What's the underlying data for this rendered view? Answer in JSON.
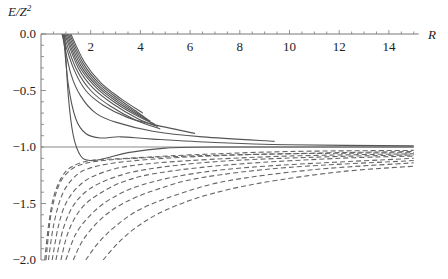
{
  "chart_data": {
    "type": "line",
    "title": "",
    "xlabel": "R",
    "ylabel": "E/Z²",
    "xlim": [
      0,
      15
    ],
    "ylim": [
      -2.0,
      0.0
    ],
    "grid": false,
    "legend": null,
    "x_ticks": [
      "2",
      "4",
      "6",
      "8",
      "10",
      "12",
      "14"
    ],
    "y_ticks": [
      "0.0",
      "-0.5",
      "-1.0",
      "-1.5",
      "-2.0"
    ],
    "reference_line": {
      "y": -1.0,
      "style": "solid",
      "x_range": [
        0,
        15
      ]
    },
    "series": [
      {
        "name": "solid-1",
        "style": "solid",
        "kind": "bound-min",
        "points": [
          [
            0.95,
            0.0
          ],
          [
            1.1,
            -0.55
          ],
          [
            1.3,
            -0.9
          ],
          [
            1.6,
            -1.08
          ],
          [
            2.0,
            -1.12
          ],
          [
            2.6,
            -1.1
          ],
          [
            3.5,
            -1.05
          ],
          [
            5,
            -1.01
          ],
          [
            7,
            -1.0
          ],
          [
            15,
            -1.0
          ]
        ]
      },
      {
        "name": "solid-2",
        "style": "solid",
        "kind": "shoulder",
        "points": [
          [
            0.9,
            0.0
          ],
          [
            1.1,
            -0.45
          ],
          [
            1.4,
            -0.75
          ],
          [
            1.8,
            -0.88
          ],
          [
            2.4,
            -0.92
          ],
          [
            3.2,
            -0.91
          ],
          [
            4.5,
            -0.93
          ],
          [
            7,
            -0.96
          ],
          [
            10,
            -0.98
          ],
          [
            15,
            -0.99
          ]
        ]
      },
      {
        "name": "solid-3",
        "style": "solid",
        "points": [
          [
            0.85,
            0.0
          ],
          [
            1.2,
            -0.35
          ],
          [
            1.6,
            -0.55
          ],
          [
            2.2,
            -0.7
          ],
          [
            3,
            -0.78
          ],
          [
            4.5,
            -0.86
          ],
          [
            6.5,
            -0.91
          ],
          [
            9.4,
            -0.95
          ]
        ]
      },
      {
        "name": "solid-4",
        "style": "solid",
        "points": [
          [
            0.85,
            0.0
          ],
          [
            1.3,
            -0.3
          ],
          [
            1.8,
            -0.5
          ],
          [
            2.5,
            -0.63
          ],
          [
            3.5,
            -0.74
          ],
          [
            4.5,
            -0.8
          ],
          [
            6.2,
            -0.88
          ]
        ]
      },
      {
        "name": "solid-5",
        "style": "solid",
        "points": [
          [
            0.9,
            0.0
          ],
          [
            1.4,
            -0.3
          ],
          [
            2,
            -0.5
          ],
          [
            2.8,
            -0.64
          ],
          [
            3.8,
            -0.76
          ],
          [
            4.8,
            -0.84
          ]
        ]
      },
      {
        "name": "solid-6",
        "style": "solid",
        "points": [
          [
            0.95,
            0.0
          ],
          [
            1.5,
            -0.3
          ],
          [
            2.1,
            -0.48
          ],
          [
            2.9,
            -0.62
          ],
          [
            3.9,
            -0.75
          ],
          [
            4.7,
            -0.82
          ]
        ]
      },
      {
        "name": "solid-7",
        "style": "solid",
        "points": [
          [
            1.0,
            0.0
          ],
          [
            1.55,
            -0.29
          ],
          [
            2.2,
            -0.47
          ],
          [
            3.0,
            -0.61
          ],
          [
            4.0,
            -0.74
          ],
          [
            4.6,
            -0.8
          ]
        ]
      },
      {
        "name": "solid-8",
        "style": "solid",
        "points": [
          [
            1.05,
            0.0
          ],
          [
            1.6,
            -0.28
          ],
          [
            2.25,
            -0.46
          ],
          [
            3.05,
            -0.6
          ],
          [
            4.0,
            -0.73
          ],
          [
            4.5,
            -0.79
          ]
        ]
      },
      {
        "name": "solid-9",
        "style": "solid",
        "points": [
          [
            1.1,
            0.0
          ],
          [
            1.65,
            -0.27
          ],
          [
            2.3,
            -0.45
          ],
          [
            3.1,
            -0.59
          ],
          [
            4.0,
            -0.72
          ],
          [
            4.4,
            -0.77
          ]
        ]
      },
      {
        "name": "solid-10",
        "style": "solid",
        "points": [
          [
            1.15,
            0.0
          ],
          [
            1.7,
            -0.26
          ],
          [
            2.35,
            -0.44
          ],
          [
            3.15,
            -0.58
          ],
          [
            4.0,
            -0.71
          ],
          [
            4.3,
            -0.76
          ]
        ]
      },
      {
        "name": "solid-11",
        "style": "solid",
        "points": [
          [
            1.2,
            0.0
          ],
          [
            1.75,
            -0.25
          ],
          [
            2.4,
            -0.43
          ],
          [
            3.2,
            -0.57
          ],
          [
            4.1,
            -0.7
          ]
        ]
      },
      {
        "name": "dashed-1",
        "style": "dashed",
        "points": [
          [
            0.15,
            -2.0
          ],
          [
            0.3,
            -1.7
          ],
          [
            0.5,
            -1.45
          ],
          [
            0.8,
            -1.28
          ],
          [
            1.2,
            -1.18
          ],
          [
            2,
            -1.12
          ],
          [
            3.5,
            -1.1
          ],
          [
            6,
            -1.07
          ],
          [
            10,
            -1.04
          ],
          [
            15,
            -1.03
          ]
        ]
      },
      {
        "name": "dashed-2",
        "style": "dashed",
        "points": [
          [
            0.3,
            -2.0
          ],
          [
            0.5,
            -1.7
          ],
          [
            0.8,
            -1.45
          ],
          [
            1.2,
            -1.3
          ],
          [
            1.8,
            -1.2
          ],
          [
            3,
            -1.14
          ],
          [
            5,
            -1.1
          ],
          [
            8,
            -1.07
          ],
          [
            12,
            -1.05
          ],
          [
            15,
            -1.04
          ]
        ]
      },
      {
        "name": "dashed-3",
        "style": "dashed",
        "points": [
          [
            0.45,
            -2.0
          ],
          [
            0.7,
            -1.7
          ],
          [
            1.0,
            -1.5
          ],
          [
            1.5,
            -1.35
          ],
          [
            2.2,
            -1.25
          ],
          [
            3.5,
            -1.17
          ],
          [
            6,
            -1.12
          ],
          [
            10,
            -1.08
          ],
          [
            15,
            -1.06
          ]
        ]
      },
      {
        "name": "dashed-4",
        "style": "dashed",
        "points": [
          [
            0.6,
            -2.0
          ],
          [
            0.9,
            -1.72
          ],
          [
            1.3,
            -1.52
          ],
          [
            1.9,
            -1.38
          ],
          [
            2.8,
            -1.28
          ],
          [
            4.2,
            -1.2
          ],
          [
            7,
            -1.13
          ],
          [
            11,
            -1.09
          ],
          [
            15,
            -1.07
          ]
        ]
      },
      {
        "name": "dashed-5",
        "style": "dashed",
        "points": [
          [
            0.8,
            -2.0
          ],
          [
            1.1,
            -1.75
          ],
          [
            1.6,
            -1.55
          ],
          [
            2.3,
            -1.42
          ],
          [
            3.4,
            -1.3
          ],
          [
            5,
            -1.22
          ],
          [
            8,
            -1.15
          ],
          [
            12,
            -1.1
          ],
          [
            15,
            -1.08
          ]
        ]
      },
      {
        "name": "dashed-6",
        "style": "dashed",
        "points": [
          [
            1.0,
            -2.0
          ],
          [
            1.4,
            -1.77
          ],
          [
            2.0,
            -1.6
          ],
          [
            2.8,
            -1.46
          ],
          [
            4,
            -1.34
          ],
          [
            6,
            -1.24
          ],
          [
            9,
            -1.17
          ],
          [
            15,
            -1.1
          ]
        ]
      },
      {
        "name": "dashed-7",
        "style": "dashed",
        "points": [
          [
            1.3,
            -2.0
          ],
          [
            1.7,
            -1.82
          ],
          [
            2.4,
            -1.64
          ],
          [
            3.3,
            -1.5
          ],
          [
            4.6,
            -1.38
          ],
          [
            6.5,
            -1.27
          ],
          [
            10,
            -1.18
          ],
          [
            15,
            -1.12
          ]
        ]
      },
      {
        "name": "dashed-8",
        "style": "dashed",
        "points": [
          [
            1.8,
            -2.0
          ],
          [
            2.3,
            -1.85
          ],
          [
            3.0,
            -1.7
          ],
          [
            4.0,
            -1.55
          ],
          [
            5.5,
            -1.42
          ],
          [
            7.5,
            -1.3
          ],
          [
            11,
            -1.2
          ],
          [
            15,
            -1.14
          ]
        ]
      },
      {
        "name": "dashed-9",
        "style": "dashed",
        "points": [
          [
            2.5,
            -2.0
          ],
          [
            3.1,
            -1.85
          ],
          [
            3.9,
            -1.7
          ],
          [
            5,
            -1.56
          ],
          [
            6.6,
            -1.43
          ],
          [
            8.8,
            -1.32
          ],
          [
            12,
            -1.22
          ],
          [
            15,
            -1.17
          ]
        ]
      },
      {
        "name": "dashed-10",
        "style": "dashed",
        "points": [
          [
            0.2,
            -2.0
          ],
          [
            0.4,
            -1.6
          ],
          [
            0.7,
            -1.35
          ],
          [
            1.1,
            -1.22
          ],
          [
            1.7,
            -1.15
          ],
          [
            3,
            -1.11
          ],
          [
            6,
            -1.08
          ],
          [
            10,
            -1.06
          ],
          [
            15,
            -1.05
          ]
        ]
      }
    ]
  },
  "axes": {
    "x_label": "R",
    "y_label_main": "E/Z",
    "y_label_sup": "2",
    "x_ticks": [
      {
        "value": 2,
        "label": "2"
      },
      {
        "value": 4,
        "label": "4"
      },
      {
        "value": 6,
        "label": "6"
      },
      {
        "value": 8,
        "label": "8"
      },
      {
        "value": 10,
        "label": "10"
      },
      {
        "value": 12,
        "label": "12"
      },
      {
        "value": 14,
        "label": "14"
      }
    ],
    "y_ticks": [
      {
        "value": 0.0,
        "label": "0.0"
      },
      {
        "value": -0.5,
        "label": "−0.5"
      },
      {
        "value": -1.0,
        "label": "−1.0"
      },
      {
        "value": -1.5,
        "label": "−1.5"
      },
      {
        "value": -2.0,
        "label": "−2.0"
      }
    ]
  },
  "colors": {
    "axis": "#777777",
    "solid": "#555555",
    "dashed": "#666666",
    "reference": "#888888"
  }
}
